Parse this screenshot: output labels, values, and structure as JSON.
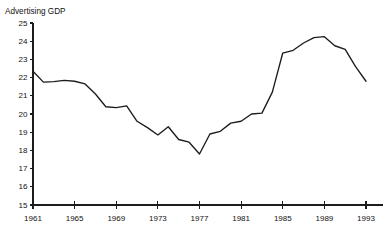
{
  "page": {
    "clipped_header_text": "",
    "background_color": "#ffffff",
    "line_color": "#1c1c1c",
    "axis_color": "#1c1c1c",
    "text_color": "#111111"
  },
  "axis_title": "Advertising GDP",
  "chart_data": {
    "type": "line",
    "title": "",
    "subtitle": "",
    "xlabel": "",
    "ylabel": "Advertising GDP",
    "ylim": [
      15,
      25
    ],
    "xlim": [
      1961,
      1993
    ],
    "grid": false,
    "legend": null,
    "legend_position": "none",
    "y_ticks": [
      15,
      16,
      17,
      18,
      19,
      20,
      21,
      22,
      23,
      24,
      25
    ],
    "y_tick_labels": [
      "15",
      "16",
      "17",
      "18",
      "19",
      "20",
      "21",
      "22",
      "23",
      "24",
      "25"
    ],
    "x_ticks": [
      1961,
      1965,
      1969,
      1973,
      1977,
      1981,
      1985,
      1989,
      1993
    ],
    "x_tick_labels": [
      "1961",
      "1965",
      "1969",
      "1973",
      "1977",
      "1981",
      "1985",
      "1989",
      "1993"
    ],
    "x": [
      1961,
      1962,
      1963,
      1964,
      1965,
      1966,
      1967,
      1968,
      1969,
      1970,
      1971,
      1972,
      1973,
      1974,
      1975,
      1976,
      1977,
      1978,
      1979,
      1980,
      1981,
      1982,
      1983,
      1984,
      1985,
      1986,
      1987,
      1988,
      1989,
      1990,
      1991,
      1992,
      1993
    ],
    "values": [
      22.35,
      21.75,
      21.78,
      21.85,
      21.8,
      21.65,
      21.1,
      20.4,
      20.35,
      20.45,
      19.6,
      19.25,
      18.85,
      19.3,
      18.6,
      18.45,
      17.8,
      18.9,
      19.05,
      19.5,
      19.6,
      20.0,
      20.05,
      21.2,
      23.35,
      23.5,
      23.9,
      24.2,
      24.25,
      23.75,
      23.55,
      22.6,
      21.8
    ],
    "series": [
      {
        "name": "Advertising GDP",
        "values": [
          22.35,
          21.75,
          21.78,
          21.85,
          21.8,
          21.65,
          21.1,
          20.4,
          20.35,
          20.45,
          19.6,
          19.25,
          18.85,
          19.3,
          18.6,
          18.45,
          17.8,
          18.9,
          19.05,
          19.5,
          19.6,
          20.0,
          20.05,
          21.2,
          23.35,
          23.5,
          23.9,
          24.2,
          24.25,
          23.75,
          23.55,
          22.6,
          21.8
        ]
      }
    ],
    "annotations": [],
    "minimum": {
      "x": 1977,
      "y": 17.8
    },
    "maximum": {
      "x": 1989,
      "y": 24.25
    }
  }
}
